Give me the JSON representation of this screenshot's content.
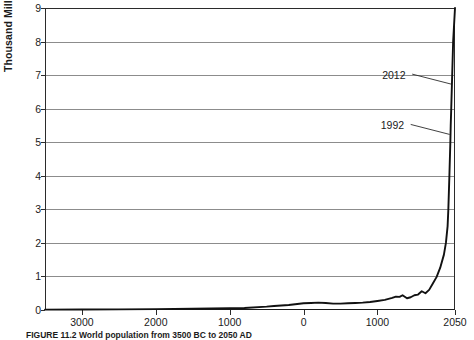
{
  "chart_data": {
    "type": "line",
    "title": "",
    "xlabel": "",
    "ylabel": "Thousand Million People",
    "ylim": [
      0,
      9
    ],
    "xlim": [
      -3500,
      2050
    ],
    "grid": true,
    "legend": "none",
    "y_ticks": [
      0,
      1,
      2,
      3,
      4,
      5,
      6,
      7,
      8,
      9
    ],
    "x_ticks": [
      {
        "value": -3000,
        "label": "3000"
      },
      {
        "value": -2000,
        "label": "2000"
      },
      {
        "value": -1000,
        "label": "1000"
      },
      {
        "value": 0,
        "label": "0"
      },
      {
        "value": 1000,
        "label": "1000"
      },
      {
        "value": 2050,
        "label": "2050"
      }
    ],
    "series": [
      {
        "name": "World population",
        "x": [
          -3500,
          -3000,
          -2500,
          -2000,
          -1500,
          -1000,
          -800,
          -500,
          -400,
          -200,
          0,
          100,
          200,
          300,
          400,
          500,
          600,
          700,
          800,
          900,
          1000,
          1100,
          1200,
          1250,
          1300,
          1340,
          1400,
          1450,
          1500,
          1550,
          1600,
          1650,
          1700,
          1750,
          1800,
          1850,
          1900,
          1927,
          1950,
          1960,
          1974,
          1987,
          1992,
          1999,
          2012,
          2025,
          2050
        ],
        "y": [
          0.01,
          0.014,
          0.02,
          0.027,
          0.038,
          0.05,
          0.06,
          0.1,
          0.12,
          0.15,
          0.2,
          0.21,
          0.22,
          0.21,
          0.19,
          0.19,
          0.2,
          0.21,
          0.22,
          0.24,
          0.27,
          0.3,
          0.36,
          0.4,
          0.39,
          0.44,
          0.35,
          0.38,
          0.44,
          0.46,
          0.56,
          0.5,
          0.6,
          0.79,
          0.98,
          1.26,
          1.65,
          2.0,
          2.5,
          3.0,
          4.0,
          5.0,
          5.5,
          6.0,
          7.0,
          8.0,
          9.0
        ]
      }
    ],
    "annotations": [
      {
        "label": "2012",
        "x": 2012,
        "y": 7.0
      },
      {
        "label": "1992",
        "x": 1992,
        "y": 5.5
      }
    ]
  },
  "caption": "FIGURE 11.2   World population from 3500 BC to 2050 AD",
  "axis": {
    "y_title": "Thousand Million People"
  }
}
